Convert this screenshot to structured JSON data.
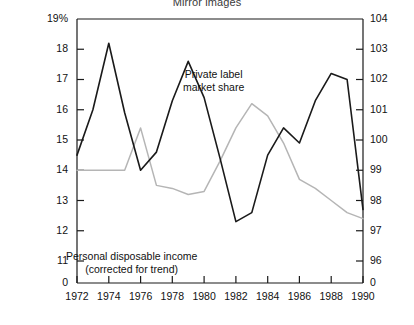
{
  "chart_data": {
    "type": "line",
    "title": "Mirror images",
    "xlabel": "",
    "ylabel": "",
    "grid": false,
    "legend_position": "inline-annotations",
    "x": [
      1972,
      1973,
      1974,
      1975,
      1976,
      1977,
      1978,
      1979,
      1980,
      1981,
      1982,
      1983,
      1984,
      1985,
      1986,
      1987,
      1988,
      1989,
      1990
    ],
    "xlim": [
      1972,
      1990
    ],
    "xticks": [
      1972,
      1974,
      1976,
      1978,
      1980,
      1982,
      1984,
      1986,
      1988,
      1990
    ],
    "xtick_labels": [
      "1972",
      "1974",
      "1976",
      "1978",
      "1980",
      "1982",
      "1984",
      "1986",
      "1988",
      "1990"
    ],
    "left_axis": {
      "label": "19%",
      "unit": "%",
      "ylim": [
        11,
        19
      ],
      "ticks": [
        11,
        12,
        13,
        14,
        15,
        16,
        17,
        18,
        19
      ],
      "tick_labels": [
        "11",
        "12",
        "13",
        "14",
        "15",
        "16",
        "17",
        "18",
        "19%"
      ],
      "zero_break_label": "0"
    },
    "right_axis": {
      "ylim": [
        96,
        104
      ],
      "ticks": [
        96,
        97,
        98,
        99,
        100,
        101,
        102,
        103,
        104
      ],
      "tick_labels": [
        "96",
        "97",
        "98",
        "99",
        "100",
        "101",
        "102",
        "103",
        "104"
      ],
      "zero_break_label": "0"
    },
    "series": [
      {
        "name": "Personal disposable income (corrected for trend)",
        "axis": "right",
        "color": "#1a1a1a",
        "annotation": "Personal disposable income\n(corrected for trend)",
        "values": [
          99.5,
          101.0,
          103.2,
          100.9,
          99.0,
          99.6,
          101.3,
          102.6,
          101.4,
          99.4,
          97.3,
          97.6,
          99.5,
          100.4,
          99.9,
          101.3,
          102.2,
          102.0,
          97.7
        ]
      },
      {
        "name": "Private label market share",
        "axis": "left",
        "color": "#b5b5b5",
        "annotation": "Private label market share",
        "values": [
          14.0,
          14.0,
          14.0,
          14.0,
          15.4,
          13.5,
          13.4,
          13.2,
          13.3,
          14.3,
          15.4,
          16.2,
          15.8,
          14.9,
          13.7,
          13.4,
          13.0,
          12.6,
          12.4
        ]
      }
    ],
    "annotations": [
      {
        "id": "private-label",
        "lines": [
          "Private label",
          "market share"
        ]
      },
      {
        "id": "personal-disposable-income",
        "lines": [
          "Personal disposable income",
          "(corrected for trend)"
        ]
      }
    ],
    "colors": {
      "axis": "#1a1a1a",
      "series_black": "#1a1a1a",
      "series_grey": "#b5b5b5",
      "title": "#3a3a3a",
      "background": "#ffffff"
    }
  }
}
